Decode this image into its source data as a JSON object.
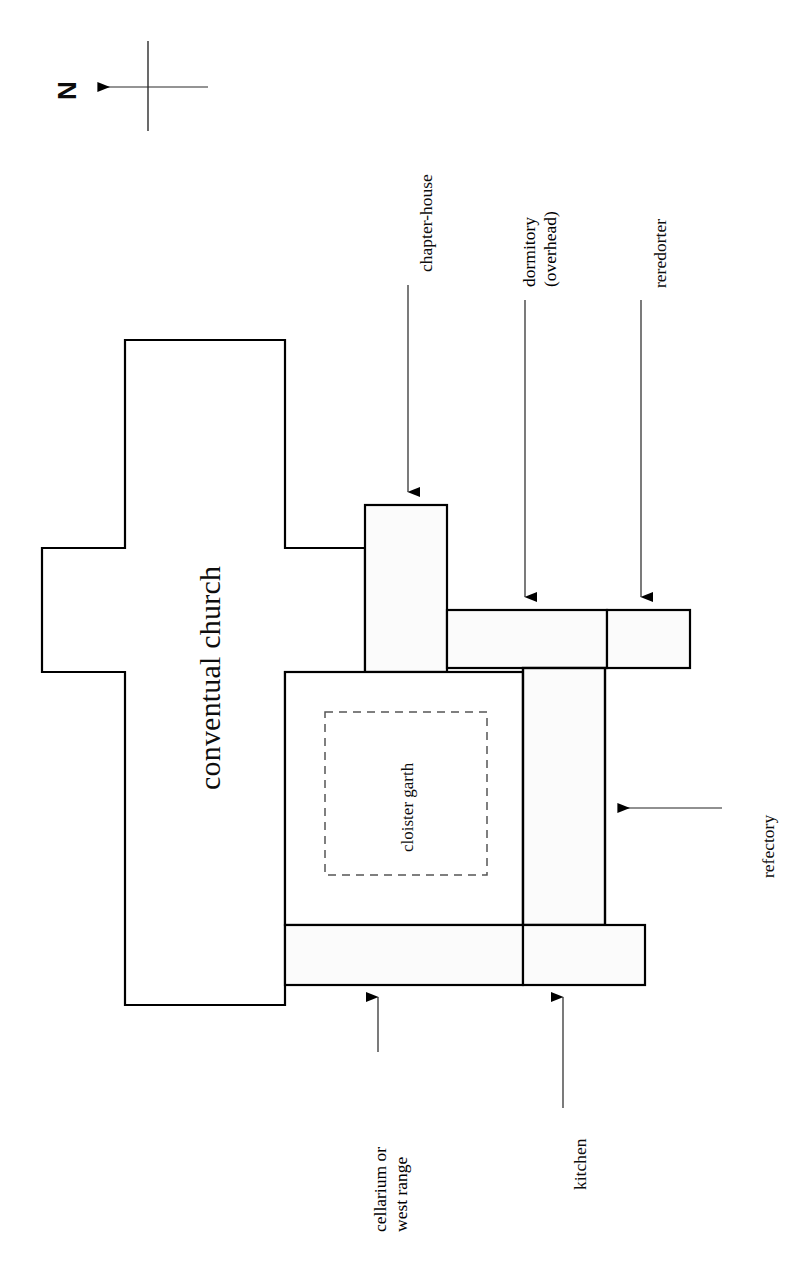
{
  "figure": {
    "type": "architectural-floor-plan",
    "orientation_marker": {
      "letter": "N",
      "icon": "north-arrow-icon",
      "arrow_direction": "left"
    },
    "stroke_color": "#000000",
    "fill_color": "#ffffff",
    "garth_outline_style": "dashed"
  },
  "rooms": [
    {
      "id": "conventual-church",
      "label": "conventual church",
      "shape": "cruciform",
      "label_rotation_deg": -90
    },
    {
      "id": "chapter-house",
      "label": "chapter-house",
      "shape": "rectangle",
      "label_rotation_deg": -90
    },
    {
      "id": "dormitory",
      "label": "dormitory",
      "sublabel": "(overhead)",
      "shape": "rectangle",
      "label_rotation_deg": -90
    },
    {
      "id": "reredorter",
      "label": "reredorter",
      "shape": "rectangle",
      "label_rotation_deg": -90
    },
    {
      "id": "refectory",
      "label": "refectory",
      "shape": "rectangle",
      "label_rotation_deg": -90
    },
    {
      "id": "cellarium-west-range",
      "label": "cellarium or",
      "sublabel": "west range",
      "shape": "rectangle",
      "label_rotation_deg": -90
    },
    {
      "id": "kitchen",
      "label": "kitchen",
      "shape": "rectangle",
      "label_rotation_deg": -90
    },
    {
      "id": "cloister-garth",
      "label": "cloister garth",
      "shape": "dashed-rectangle",
      "label_rotation_deg": -90
    }
  ],
  "labels": {
    "north": "N",
    "conventual_church": "conventual church",
    "cloister_garth": "cloister garth",
    "chapter_house": "chapter-house",
    "dormitory_line1": "dormitory",
    "dormitory_line2": "(overhead)",
    "reredorter": "reredorter",
    "refectory": "refectory",
    "cellarium_line1": "cellarium or",
    "cellarium_line2": "west range",
    "kitchen": "kitchen"
  },
  "leader_lines": [
    {
      "target": "chapter-house",
      "direction": "down"
    },
    {
      "target": "dormitory",
      "direction": "down"
    },
    {
      "target": "reredorter",
      "direction": "down"
    },
    {
      "target": "refectory",
      "direction": "left"
    },
    {
      "target": "cellarium-west-range",
      "direction": "up"
    },
    {
      "target": "kitchen",
      "direction": "up"
    }
  ]
}
